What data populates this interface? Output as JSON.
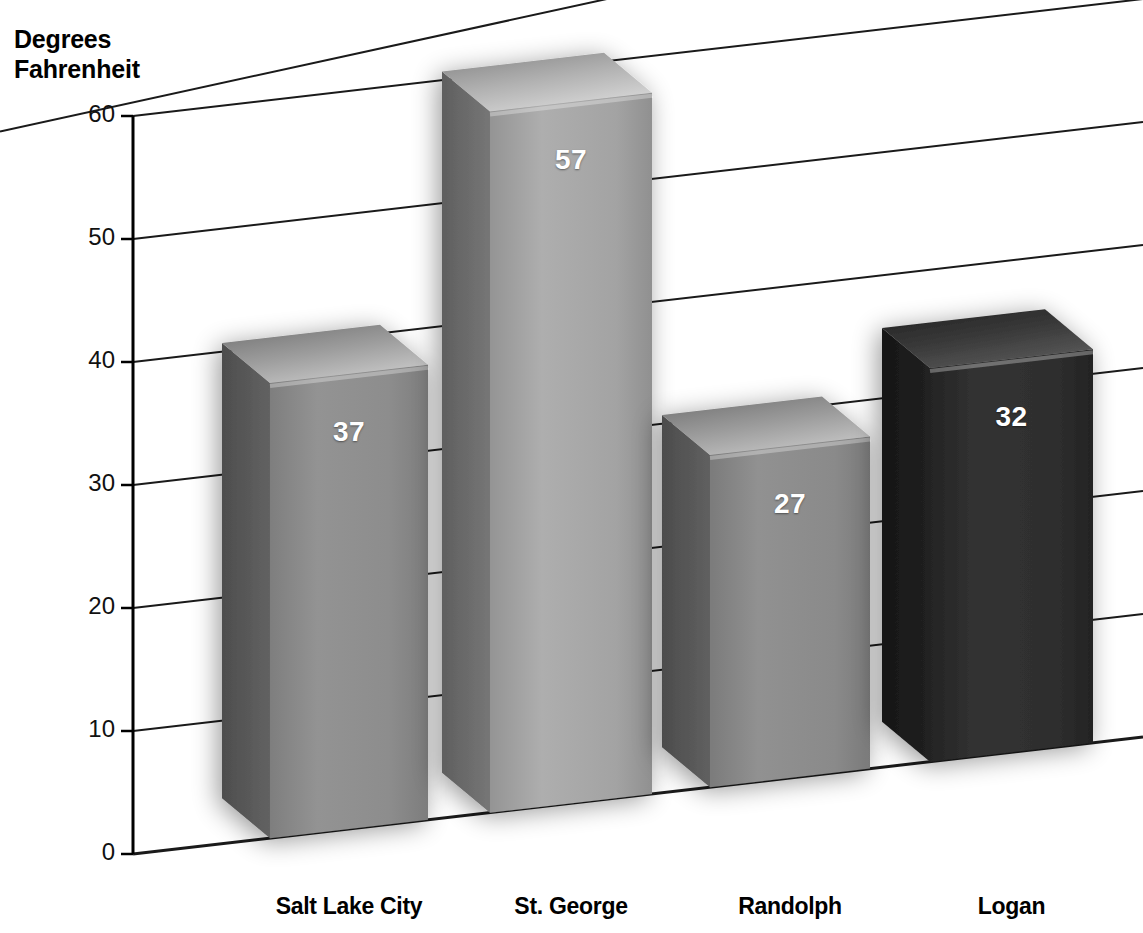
{
  "axis_title": "Degrees\nFahrenheit",
  "chart_data": {
    "type": "bar",
    "title": "",
    "subtitle": "",
    "xlabel": "",
    "ylabel": "Degrees Fahrenheit",
    "categories": [
      "Salt Lake City",
      "St. George",
      "Randolph",
      "Logan"
    ],
    "values": [
      37,
      57,
      27,
      32
    ],
    "data_labels": [
      "37",
      "57",
      "27",
      "32"
    ],
    "ylim": [
      0,
      60
    ],
    "yticks": [
      0,
      10,
      20,
      30,
      40,
      50,
      60
    ],
    "ytick_labels": [
      "0",
      "10",
      "20",
      "30",
      "40",
      "50",
      "60"
    ],
    "grid": true,
    "legend": false,
    "legend_position": "none",
    "three_d": true,
    "bar_colors": [
      "#8d8d8d",
      "#a3a3a3",
      "#8a8a8a",
      "#2b2b2b"
    ],
    "bar_side_colors": [
      "#575757",
      "#6b6b6b",
      "#565656",
      "#1b1b1b"
    ],
    "bar_top_colors": [
      "#b6b6b6",
      "#c9c9c9",
      "#b2b2b2",
      "#4a4a4a"
    ],
    "axis_color": "#000000",
    "grid_color": "#1a1a1a",
    "background": "#ffffff",
    "value_label_color": "#ffffff"
  },
  "ticks": [
    {
      "label": "60",
      "value": 60
    },
    {
      "label": "50",
      "value": 50
    },
    {
      "label": "40",
      "value": 40
    },
    {
      "label": "30",
      "value": 30
    },
    {
      "label": "20",
      "value": 20
    },
    {
      "label": "10",
      "value": 10
    },
    {
      "label": "0",
      "value": 0
    }
  ],
  "bars": [
    {
      "label": "Salt Lake City",
      "value": 37,
      "display": "37"
    },
    {
      "label": "St. George",
      "value": 57,
      "display": "57"
    },
    {
      "label": "Randolph",
      "value": 27,
      "display": "27"
    },
    {
      "label": "Logan",
      "value": 32,
      "display": "32"
    }
  ]
}
